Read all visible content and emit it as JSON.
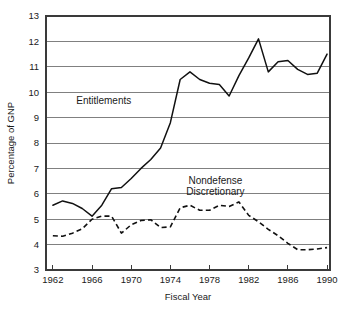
{
  "chart_data": {
    "type": "line",
    "title": "",
    "subtitle": "",
    "xlabel": "Fiscal Year",
    "ylabel": "Percentage of GNP",
    "xlim": [
      1961.3,
      1990.3
    ],
    "ylim": [
      3,
      13
    ],
    "grid": "horizontal",
    "legend_position": "inline-annotations",
    "x_ticks": [
      1962,
      1966,
      1970,
      1974,
      1978,
      1982,
      1986,
      1990
    ],
    "x_tick_labels": [
      "1962",
      "1966",
      "1970",
      "1974",
      "1978",
      "1982",
      "1986",
      "1990"
    ],
    "y_ticks": [
      3,
      4,
      5,
      6,
      7,
      8,
      9,
      10,
      11,
      12,
      13
    ],
    "y_tick_labels": [
      "3",
      "4",
      "5",
      "6",
      "7",
      "8",
      "9",
      "10",
      "11",
      "12",
      "13"
    ],
    "annotations": [
      {
        "name": "entitlements-label",
        "text": "Entitlements",
        "x": 1967.2,
        "y": 9.55
      },
      {
        "name": "nondefense-label-line1",
        "text": "Nondefense",
        "x": 1978.6,
        "y": 6.4
      },
      {
        "name": "nondefense-label-line2",
        "text": "Discretionary",
        "x": 1978.6,
        "y": 5.95
      }
    ],
    "x": [
      1962,
      1963,
      1964,
      1965,
      1966,
      1967,
      1968,
      1969,
      1970,
      1971,
      1972,
      1973,
      1974,
      1975,
      1976,
      1977,
      1978,
      1979,
      1980,
      1981,
      1982,
      1983,
      1984,
      1985,
      1986,
      1987,
      1988,
      1989,
      1990
    ],
    "series": [
      {
        "name": "Entitlements",
        "style": "solid",
        "color": "#111111",
        "values": [
          5.55,
          5.72,
          5.62,
          5.42,
          5.12,
          5.55,
          6.2,
          6.25,
          6.6,
          7.0,
          7.35,
          7.8,
          8.8,
          10.5,
          10.8,
          10.5,
          10.35,
          10.3,
          9.85,
          10.65,
          11.35,
          12.1,
          10.8,
          11.2,
          11.25,
          10.9,
          10.7,
          10.75,
          11.5
        ]
      },
      {
        "name": "Nondefense Discretionary",
        "style": "dashed",
        "color": "#111111",
        "values": [
          4.35,
          4.33,
          4.45,
          4.62,
          5.0,
          5.12,
          5.12,
          4.45,
          4.78,
          4.95,
          4.98,
          4.67,
          4.7,
          5.45,
          5.55,
          5.35,
          5.35,
          5.55,
          5.5,
          5.68,
          5.15,
          4.9,
          4.6,
          4.35,
          4.05,
          3.8,
          3.8,
          3.83,
          3.88
        ]
      }
    ]
  },
  "figure": {
    "plot_left": 46,
    "plot_top": 16,
    "plot_right": 330,
    "plot_bottom": 270
  }
}
